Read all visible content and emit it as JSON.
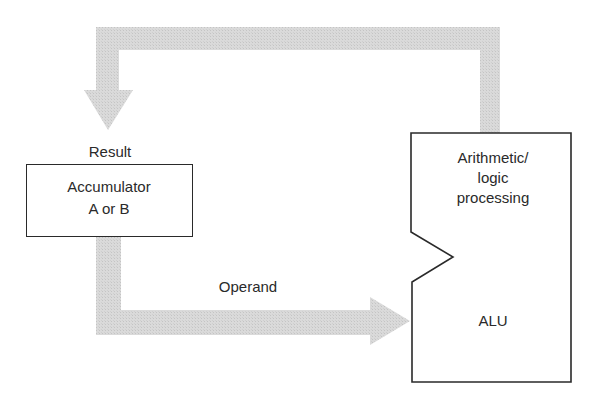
{
  "diagram": {
    "accumulator": {
      "line1": "Accumulator",
      "line2": "A or B"
    },
    "alu": {
      "line1": "Arithmetic/",
      "line2": "logic",
      "line3": "processing",
      "name": "ALU"
    },
    "labels": {
      "result": "Result",
      "operand": "Operand"
    },
    "colors": {
      "arrow": "#d6d6d6",
      "stroke": "#2a2a2a",
      "background": "#ffffff"
    }
  }
}
